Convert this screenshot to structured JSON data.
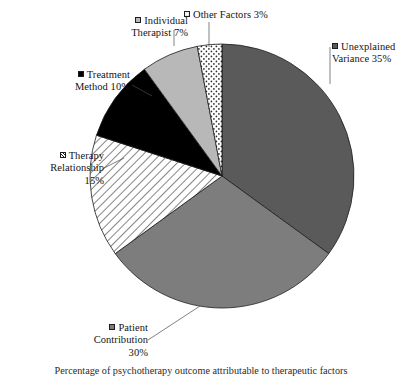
{
  "figure": {
    "caption": "Percentage of psychotherapy outcome attributable to therapeutic factors"
  },
  "chart_data": {
    "type": "pie",
    "title": "",
    "xlabel": "",
    "ylabel": "",
    "legend_position": "callout-labels",
    "total": 100,
    "units": "percent",
    "start_angle_deg": 0,
    "direction": "clockwise",
    "center": {
      "x": 222,
      "y": 176
    },
    "radius": 132,
    "categories": [
      "Unexplained Variance",
      "Patient Contribution",
      "Therapy Relationship",
      "Treatment Method",
      "Individual Therapist",
      "Other Factors"
    ],
    "values": [
      35,
      30,
      15,
      10,
      7,
      3
    ],
    "slices": [
      {
        "name": "Unexplained Variance",
        "value": 35,
        "label_line1": "Unexplained",
        "label_line2": "Variance 35%",
        "percent_text": "35%",
        "fill": "#5a5a5a",
        "pattern": "solid",
        "swatch_class": "sw-solid-dark",
        "start_deg": 0,
        "end_deg": 126
      },
      {
        "name": "Patient Contribution",
        "value": 30,
        "label_line1": "Patient",
        "label_line2": "Contribution",
        "label_line3": "30%",
        "percent_text": "30%",
        "fill": "#7d7d7d",
        "pattern": "solid",
        "swatch_class": "sw-solid-mid",
        "start_deg": 126,
        "end_deg": 234
      },
      {
        "name": "Therapy Relationship",
        "value": 15,
        "label_line1": "Therapy",
        "label_line2": "Relationship",
        "label_line3": "15%",
        "percent_text": "15%",
        "fill": "#ffffff",
        "pattern": "diagonal-hatch",
        "swatch_class": "sw-hatch",
        "start_deg": 234,
        "end_deg": 288
      },
      {
        "name": "Treatment Method",
        "value": 10,
        "label_line1": "Treatment",
        "label_line2": "Method 10%",
        "percent_text": "10%",
        "fill": "#000000",
        "pattern": "solid",
        "swatch_class": "sw-solid-black",
        "start_deg": 288,
        "end_deg": 324
      },
      {
        "name": "Individual Therapist",
        "value": 7,
        "label_line1": "Individual",
        "label_line2": "Therapist 7%",
        "percent_text": "7%",
        "fill": "#b8b8b8",
        "pattern": "solid",
        "swatch_class": "sw-solid-light",
        "start_deg": 324,
        "end_deg": 349.2
      },
      {
        "name": "Other Factors",
        "value": 3,
        "label_line1": "Other Factors 3%",
        "percent_text": "3%",
        "fill": "#ffffff",
        "pattern": "dots",
        "swatch_class": "sw-dots",
        "start_deg": 349.2,
        "end_deg": 360
      }
    ]
  }
}
